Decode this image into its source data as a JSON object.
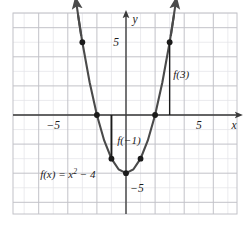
{
  "figure": {
    "name": "parabola-graph",
    "background_color": "#ffffff",
    "plot_area": {
      "x": 13,
      "y": 13,
      "width": 224,
      "height": 201
    },
    "grid": {
      "minor_color": "#e2e2e6",
      "major_color": "#c2c2c8",
      "border_color": "#c2c2c8",
      "unit_px": 14.55,
      "major_every": 2,
      "visible": true
    },
    "axes": {
      "color": "#3a3a3a",
      "origin_px": {
        "x": 126,
        "y": 115
      },
      "x_label": "x",
      "y_label": "y",
      "x_ticks": [
        {
          "label": "−5",
          "value": -5
        },
        {
          "label": "5",
          "value": 5
        }
      ],
      "y_ticks": [
        {
          "label": "5",
          "value": 5
        },
        {
          "label": "−5",
          "value": -5
        }
      ],
      "xlim": [
        -7.7,
        7.6
      ],
      "ylim": [
        -6.8,
        7.0
      ]
    }
  },
  "chart_data": {
    "type": "line",
    "title": "",
    "xlabel": "x",
    "ylabel": "y",
    "xlim": [
      -7.7,
      7.6
    ],
    "ylim": [
      -6.8,
      7.0
    ],
    "grid": true,
    "legend": "none",
    "function_expression": "f(x) = x² − 4",
    "series": [
      {
        "name": "f(x) = x^2 - 4",
        "curve_color": "#4a4a4a",
        "x": [
          -3.3,
          -3,
          -2.5,
          -2,
          -1.5,
          -1,
          -0.5,
          0,
          0.5,
          1,
          1.5,
          2,
          2.5,
          3,
          3.3
        ],
        "values": [
          6.89,
          5,
          2.25,
          0,
          -1.75,
          -3,
          -3.75,
          -4,
          -3.75,
          -3,
          -1.75,
          0,
          2.25,
          5,
          6.89
        ]
      }
    ],
    "points": [
      {
        "x": -3,
        "y": 5
      },
      {
        "x": -2,
        "y": 0
      },
      {
        "x": -1,
        "y": -3
      },
      {
        "x": 0,
        "y": -4
      },
      {
        "x": 1,
        "y": -3
      },
      {
        "x": 2,
        "y": 0
      },
      {
        "x": 3,
        "y": 5
      }
    ],
    "annotations": [
      {
        "name": "f-of-negative-one",
        "label": "f(−1)",
        "segment": {
          "x": -1,
          "y_from": 0,
          "y_to": -3
        },
        "label_pos": {
          "x": -0.6,
          "y": -2.0
        }
      },
      {
        "name": "f-of-three",
        "label": "f(3)",
        "segment": {
          "x": 3,
          "y_from": 0,
          "y_to": 5
        },
        "label_pos": {
          "x": 3.25,
          "y": 2.55
        }
      },
      {
        "name": "function-equation",
        "label": "f(x) = x² − 4",
        "label_pos": {
          "x": -5.9,
          "y": -4.35
        }
      }
    ],
    "arrows": [
      {
        "name": "curve-arrow-left",
        "at": {
          "x": -3.3,
          "y": 6.89
        }
      },
      {
        "name": "curve-arrow-right",
        "at": {
          "x": 3.3,
          "y": 6.89
        }
      },
      {
        "name": "x-axis-arrow-right",
        "at": {
          "x": 7.5,
          "y": 0
        }
      },
      {
        "name": "y-axis-arrow-up",
        "at": {
          "x": 0,
          "y": 6.9
        }
      }
    ]
  },
  "labels": {
    "equation": "f(x) = x² − 4",
    "f_neg_one": "f(−1)",
    "f_three": "f(3)",
    "axis_x": "x",
    "axis_y": "y",
    "tick_x_neg5": "−5",
    "tick_x_pos5": "5",
    "tick_y_pos5": "5",
    "tick_y_neg5": "−5"
  }
}
